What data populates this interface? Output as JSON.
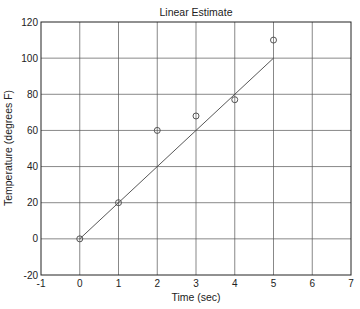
{
  "chart_data": {
    "type": "scatter",
    "title": "Linear Estimate",
    "xlabel": "Time (sec)",
    "ylabel": "Temperature (degrees F)",
    "xlim": [
      -1,
      7
    ],
    "ylim": [
      -20,
      120
    ],
    "xticks": [
      -1,
      0,
      1,
      2,
      3,
      4,
      5,
      6,
      7
    ],
    "yticks": [
      -20,
      0,
      20,
      40,
      60,
      80,
      100,
      120
    ],
    "grid": true,
    "legend": null,
    "series": [
      {
        "name": "measured",
        "type": "scatter",
        "marker": "circle",
        "x": [
          0,
          1,
          2,
          3,
          4,
          5
        ],
        "y": [
          0,
          20,
          60,
          68,
          77,
          110
        ]
      },
      {
        "name": "linear estimate",
        "type": "line",
        "x": [
          0,
          5
        ],
        "y": [
          0,
          100
        ]
      }
    ]
  },
  "colors": {
    "axes": "#222222",
    "grid": "#555555",
    "line": "#444444",
    "marker": "#444444"
  }
}
